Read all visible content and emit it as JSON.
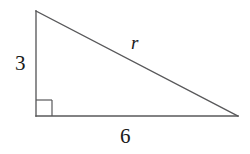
{
  "figure": {
    "type": "right-triangle-diagram",
    "background_color": "#ffffff",
    "stroke_color": "#58585a",
    "text_color": "#1a1a1a",
    "stroke_width": 1.3
  },
  "geometry": {
    "vertices": {
      "top": {
        "x": 36,
        "y": 11
      },
      "bottom_left": {
        "x": 36,
        "y": 116
      },
      "bottom_right": {
        "x": 238,
        "y": 116
      }
    },
    "right_angle_marker": {
      "at_vertex": "bottom_left",
      "size": 16,
      "x": 36,
      "y": 100,
      "width": 16,
      "height": 16
    },
    "polygon_points": "36,11 36,116 238,116"
  },
  "labels": {
    "vertical_leg": "3",
    "horizontal_leg": "6",
    "hypotenuse": "r"
  }
}
